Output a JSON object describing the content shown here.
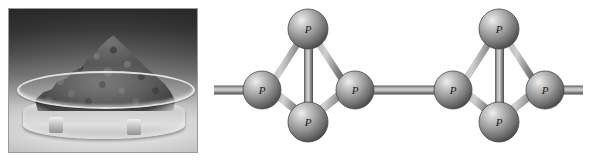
{
  "figure": {
    "background_color": "#ffffff",
    "width": 597,
    "height": 161
  },
  "photo_panel": {
    "caption": "",
    "alt_text": "Grayscale photograph of dark red phosphorus powder heaped in a glass petri dish",
    "border_color": "#9a9a9a",
    "background_top_color": "#2b2b2b",
    "background_bottom_color": "#e3e3e3",
    "objects": [
      {
        "name": "petri-dish",
        "label": ""
      },
      {
        "name": "phosphorus-powder-heap",
        "label": ""
      }
    ]
  },
  "molecule_panel": {
    "alt_text": "Ball-and-stick diagram of two linked P4 tetrahedral units",
    "atom_colors": {
      "highlight": "#e8e8e8",
      "mid": "#8d8d8d",
      "shadow": "#3f3f3f",
      "outline": "#4a4a4a"
    },
    "bond_colors": {
      "highlight": "#d5d5d5",
      "mid": "#8e8e8e",
      "shadow": "#4d4d4d"
    },
    "units": [
      {
        "name": "tetrahedron-unit-1",
        "atoms": [
          {
            "id": "u1-top",
            "label": "P",
            "cx": 108,
            "cy": 29,
            "r": 20
          },
          {
            "id": "u1-left",
            "label": "P",
            "cx": 62,
            "cy": 90,
            "r": 19
          },
          {
            "id": "u1-right",
            "label": "P",
            "cx": 155,
            "cy": 90,
            "r": 19
          },
          {
            "id": "u1-bottom",
            "label": "P",
            "cx": 108,
            "cy": 122,
            "r": 20
          }
        ]
      },
      {
        "name": "tetrahedron-unit-2",
        "atoms": [
          {
            "id": "u2-top",
            "label": "P",
            "cx": 299,
            "cy": 29,
            "r": 20
          },
          {
            "id": "u2-left",
            "label": "P",
            "cx": 253,
            "cy": 90,
            "r": 19
          },
          {
            "id": "u2-right",
            "label": "P",
            "cx": 345,
            "cy": 90,
            "r": 19
          },
          {
            "id": "u2-bottom",
            "label": "P",
            "cx": 299,
            "cy": 122,
            "r": 20
          }
        ]
      }
    ],
    "terminal_bonds": [
      {
        "name": "bond-left-terminal",
        "x1": 14,
        "y1": 90,
        "x2": 62,
        "y2": 90
      },
      {
        "name": "bond-bridge",
        "x1": 155,
        "y1": 90,
        "x2": 253,
        "y2": 90
      },
      {
        "name": "bond-right-terminal",
        "x1": 345,
        "y1": 90,
        "x2": 383,
        "y2": 90
      }
    ],
    "atom_label": "P",
    "element_symbol": "P",
    "element_name": "phosphorus"
  }
}
